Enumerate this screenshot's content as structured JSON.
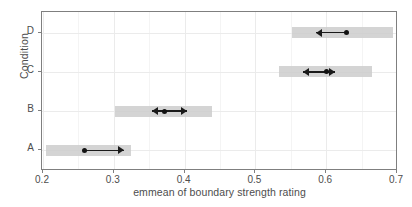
{
  "chart_data": {
    "type": "scatter",
    "title": "",
    "subtitle": "",
    "xlabel": "emmean of boundary strength rating",
    "ylabel": "Condition",
    "xlim": [
      0.2,
      0.7
    ],
    "x_ticks": [
      0.2,
      0.3,
      0.4,
      0.5,
      0.6,
      0.7
    ],
    "x_tick_labels": [
      "0.2",
      "0.3",
      "0.4",
      "0.5",
      "0.6",
      "0.7"
    ],
    "x_minor_ticks": [
      0.25,
      0.35,
      0.45,
      0.55,
      0.65
    ],
    "categories": [
      "A",
      "B",
      "C",
      "D"
    ],
    "category_order_bottom_to_top": [
      "A",
      "B",
      "C",
      "D"
    ],
    "grid": true,
    "legend": "none",
    "series": [
      {
        "name": "emmean with confidence interval and comparison arrows",
        "points": [
          {
            "category": "A",
            "emmean": 0.259,
            "ci_low": 0.204,
            "ci_high": 0.324,
            "arrow_left": null,
            "arrow_right": 0.315
          },
          {
            "category": "B",
            "emmean": 0.371,
            "ci_low": 0.302,
            "ci_high": 0.439,
            "arrow_left": 0.354,
            "arrow_right": 0.404
          },
          {
            "category": "C",
            "emmean": 0.6,
            "ci_low": 0.533,
            "ci_high": 0.665,
            "arrow_left": 0.567,
            "arrow_right": 0.612
          },
          {
            "category": "D",
            "emmean": 0.629,
            "ci_low": 0.551,
            "ci_high": 0.694,
            "arrow_left": 0.586,
            "arrow_right": null
          }
        ]
      }
    ],
    "colors": {
      "band": "#cccccc",
      "point": "#111111",
      "arrow": "#1a1a1a",
      "panel_background": "#ffffff",
      "grid_major": "#ebebeb",
      "grid_minor": "#f4f4f4",
      "axis_text": "#4d4d4d",
      "panel_border": "#7f7f7f"
    }
  }
}
